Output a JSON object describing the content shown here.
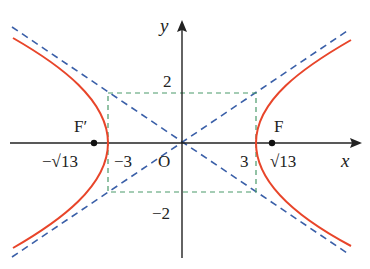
{
  "colors": {
    "curve": "#e8452a",
    "asymptote": "#3a5fa8",
    "box": "#4a9a6a",
    "axis": "#222222"
  },
  "labels": {
    "y_axis": "y",
    "x_axis": "x",
    "origin": "O",
    "y_top": "2",
    "y_bottom": "−2",
    "x_left": "−3",
    "x_right": "3",
    "focus_left": "F′",
    "focus_right": "F",
    "focus_left_value": "−√13",
    "focus_right_value": "√13"
  }
}
